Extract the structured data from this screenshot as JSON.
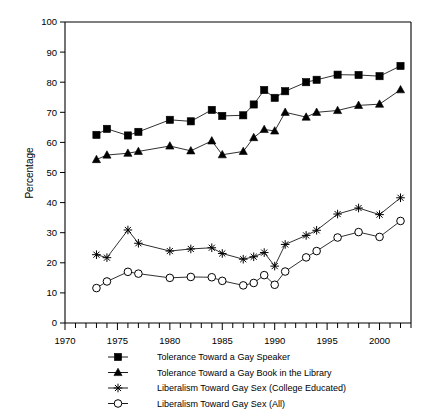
{
  "chart_data": {
    "type": "line",
    "title": "",
    "xlabel": "",
    "ylabel": "Percentage",
    "xlim": [
      1970,
      2003
    ],
    "ylim": [
      0,
      100
    ],
    "grid": false,
    "legend_position": "bottom",
    "xticks": [
      1970,
      1975,
      1980,
      1985,
      1990,
      1995,
      2000
    ],
    "xtick_labels": [
      "1970",
      "1975",
      "1980",
      "1985",
      "1990",
      "1995",
      "2000"
    ],
    "xminor_step": 1,
    "yticks": [
      0,
      10,
      20,
      30,
      40,
      50,
      60,
      70,
      80,
      90,
      100
    ],
    "ytick_labels": [
      "0",
      "10",
      "20",
      "30",
      "40",
      "50",
      "60",
      "70",
      "80",
      "90",
      "100"
    ],
    "series": [
      {
        "name": "Tolerance Toward  a Gay Speaker",
        "marker": "filled-square",
        "color": "#000000",
        "x": [
          1973,
          1974,
          1976,
          1977,
          1980,
          1982,
          1984,
          1985,
          1987,
          1988,
          1989,
          1990,
          1991,
          1993,
          1994,
          1996,
          1998,
          2000,
          2002
        ],
        "values": [
          62.5,
          64.5,
          62.3,
          63.5,
          67.5,
          67.0,
          70.8,
          68.8,
          69.0,
          72.6,
          77.4,
          74.8,
          77.0,
          80.0,
          80.8,
          82.5,
          82.4,
          82.0,
          85.4
        ]
      },
      {
        "name": "Tolerance Toward a Gay Book in the Library",
        "marker": "filled-triangle",
        "color": "#000000",
        "x": [
          1973,
          1974,
          1976,
          1977,
          1980,
          1982,
          1984,
          1985,
          1987,
          1988,
          1989,
          1990,
          1991,
          1993,
          1994,
          1996,
          1998,
          2000,
          2002
        ],
        "values": [
          54.3,
          55.8,
          56.4,
          57.0,
          58.8,
          57.2,
          60.5,
          55.9,
          57.0,
          61.6,
          64.3,
          63.8,
          70.0,
          68.4,
          70.0,
          70.6,
          72.3,
          72.7,
          77.5
        ]
      },
      {
        "name": "Liberalism Toward Gay Sex (College Educated)",
        "marker": "asterisk",
        "color": "#000000",
        "x": [
          1973,
          1974,
          1976,
          1977,
          1980,
          1982,
          1984,
          1985,
          1987,
          1988,
          1989,
          1990,
          1991,
          1993,
          1994,
          1996,
          1998,
          2000,
          2002
        ],
        "values": [
          22.7,
          21.7,
          30.9,
          26.5,
          23.9,
          24.6,
          25.0,
          23.1,
          21.2,
          22.0,
          23.4,
          18.9,
          26.1,
          29.1,
          30.8,
          36.2,
          38.2,
          36.0,
          41.6
        ]
      },
      {
        "name": "Liberalism Toward Gay Sex (All)",
        "marker": "open-circle",
        "color": "#000000",
        "x": [
          1973,
          1974,
          1976,
          1977,
          1980,
          1982,
          1984,
          1985,
          1987,
          1988,
          1989,
          1990,
          1991,
          1993,
          1994,
          1996,
          1998,
          2000,
          2002
        ],
        "values": [
          11.6,
          13.8,
          17.0,
          16.4,
          15.0,
          15.3,
          15.2,
          14.0,
          12.5,
          13.3,
          15.9,
          12.7,
          17.1,
          21.8,
          23.9,
          28.4,
          30.2,
          28.6,
          33.9
        ]
      }
    ]
  },
  "axis": {
    "ylabel": "Percentage"
  },
  "legend": {
    "items": [
      {
        "label": "Tolerance Toward  a Gay Speaker",
        "marker": "filled-square"
      },
      {
        "label": "Tolerance Toward a Gay Book in the Library",
        "marker": "filled-triangle"
      },
      {
        "label": "Liberalism Toward Gay Sex (College Educated)",
        "marker": "asterisk"
      },
      {
        "label": "Liberalism Toward Gay Sex (All)",
        "marker": "open-circle"
      }
    ]
  }
}
